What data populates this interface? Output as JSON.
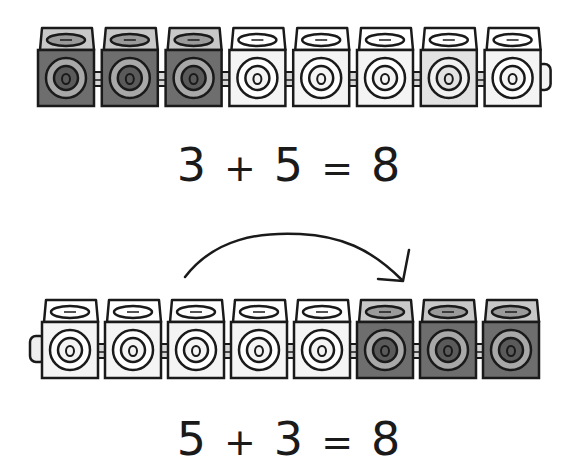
{
  "colors": {
    "dark_cube_front": "#6e6e6e",
    "dark_cube_top": "#c8c8c8",
    "light_cube_front": "#f4f4f4",
    "light_cube_top": "#ffffff",
    "mid_cube_front": "#e2e2e2",
    "outline": "#1a1a1a",
    "connector": "#d8d8d8"
  },
  "top_row": {
    "cubes": [
      "dark",
      "dark",
      "dark",
      "light",
      "light",
      "light",
      "mid",
      "light"
    ],
    "dark_count": 3,
    "light_count": 5
  },
  "equation_1": {
    "a": "3",
    "op": "+",
    "b": "5",
    "eq": "=",
    "result": "8"
  },
  "arrow": {
    "direction": "left-to-right",
    "meaning": "move block of 3 to the end"
  },
  "bottom_row": {
    "cubes": [
      "light",
      "light",
      "light",
      "light",
      "light",
      "dark",
      "dark",
      "dark"
    ],
    "light_count": 5,
    "dark_count": 3
  },
  "equation_2": {
    "a": "5",
    "op": "+",
    "b": "3",
    "eq": "=",
    "result": "8"
  }
}
